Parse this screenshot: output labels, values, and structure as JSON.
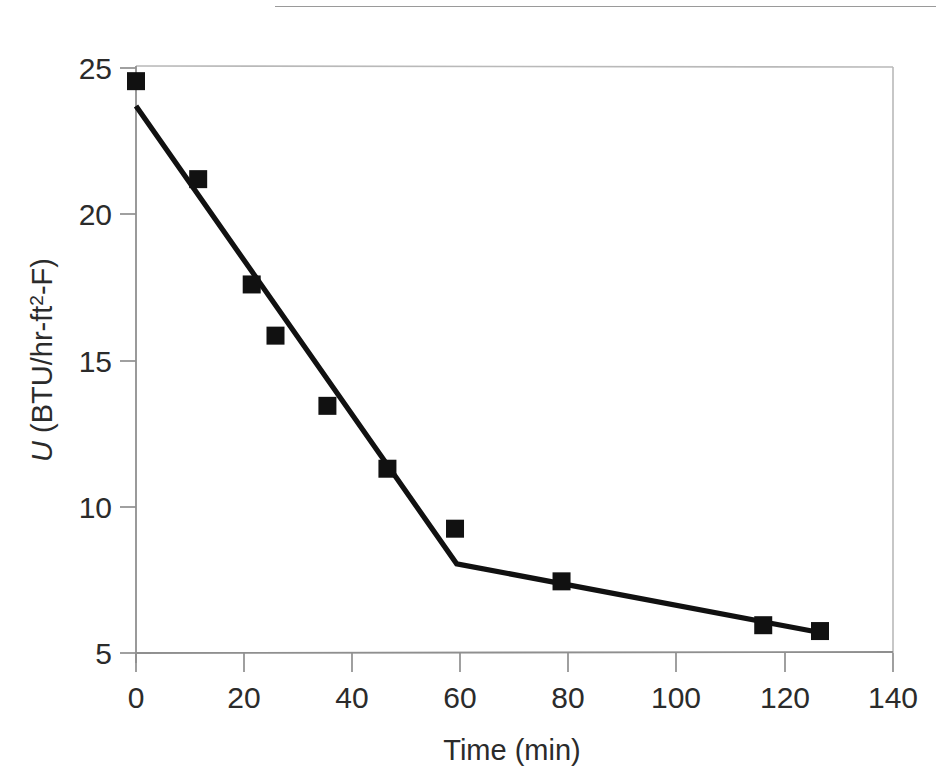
{
  "figure": {
    "page_rule": "horizontal-rule",
    "background_color": "#ffffff",
    "frame_color": "#b4b4b4",
    "data_color": "#111111"
  },
  "chart_data": {
    "type": "scatter",
    "title": "",
    "subtitle": "",
    "xlabel": "Time (min)",
    "ylabel": "U (BTU/hr-ft2-F)",
    "ylabel_parts": {
      "italic_symbol": "U",
      "unit_prefix": " (BTU/hr-ft",
      "superscript": "2",
      "unit_suffix": "-F)"
    },
    "xlim": [
      0,
      140
    ],
    "ylim": [
      5,
      25
    ],
    "xticks": [
      0,
      20,
      40,
      60,
      80,
      100,
      120,
      140
    ],
    "yticks": [
      5,
      10,
      15,
      20,
      25
    ],
    "xtick_labels": [
      "0",
      "20",
      "40",
      "60",
      "80",
      "100",
      "120",
      "140"
    ],
    "ytick_labels": [
      "5",
      "10",
      "15",
      "20",
      "25"
    ],
    "grid": false,
    "legend": null,
    "marker": "filled-square",
    "marker_size_px": 18,
    "series": [
      {
        "name": "U measured",
        "marker": "filled-square",
        "color": "#111111",
        "x": [
          0.0,
          11.5,
          21.4,
          25.8,
          35.4,
          46.5,
          59.0,
          78.7,
          116.0,
          126.5
        ],
        "y": [
          24.55,
          21.2,
          17.6,
          15.85,
          13.45,
          11.3,
          9.25,
          7.45,
          5.95,
          5.75
        ]
      },
      {
        "name": "fitted two-segment line",
        "type": "line",
        "color": "#111111",
        "x": [
          0.0,
          59.3,
          126.5
        ],
        "y": [
          23.7,
          8.05,
          5.7
        ]
      }
    ]
  }
}
